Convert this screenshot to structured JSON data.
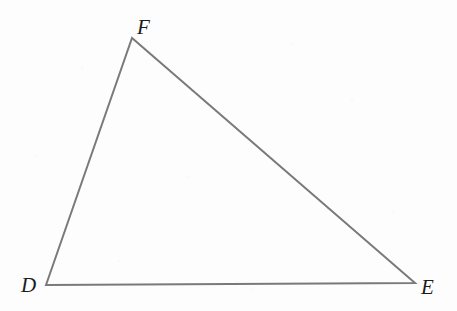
{
  "figure": {
    "name": "triangle-def",
    "width": 457,
    "height": 311,
    "background_color": "#fdfdfd",
    "stroke_color": "#7a7a7a",
    "stroke_width": 2,
    "label_color": "#1c1c1c",
    "label_font_size": 21,
    "label_style": "italic-serif"
  },
  "vertices": [
    {
      "id": "D",
      "label": "D",
      "x": 46,
      "y": 285,
      "label_x": 28,
      "label_y": 285
    },
    {
      "id": "F",
      "label": "F",
      "x": 132,
      "y": 38,
      "label_x": 143,
      "label_y": 27
    },
    {
      "id": "E",
      "label": "E",
      "x": 415,
      "y": 283,
      "label_x": 427,
      "label_y": 287
    }
  ],
  "edges": [
    {
      "id": "DF",
      "from": "D",
      "to": "F",
      "label": ""
    },
    {
      "id": "FE",
      "from": "F",
      "to": "E",
      "label": ""
    },
    {
      "id": "ED",
      "from": "E",
      "to": "D",
      "label": ""
    }
  ],
  "path": "M 46 285 L 132 38 L 415 283 Z"
}
